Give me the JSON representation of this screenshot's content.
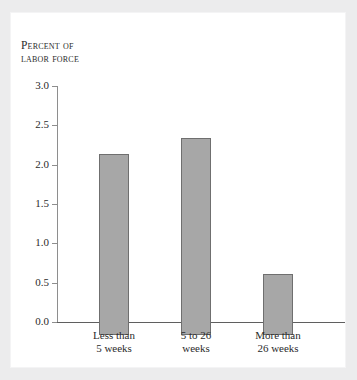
{
  "figure": {
    "background_color": "#ececed",
    "panel_color": "#ffffff"
  },
  "chart_data": {
    "type": "bar",
    "title": "",
    "subtitle": "",
    "ylabel_line1": "Percent of",
    "ylabel_line2": "labor force",
    "ylabel": "Percent of labor force",
    "xlabel": "",
    "categories": [
      "Less than 5 weeks",
      "5 to 26 weeks",
      "More than 26 weeks"
    ],
    "category_lines": [
      [
        "Less than",
        "5 weeks"
      ],
      [
        "5 to 26",
        "weeks"
      ],
      [
        "More than",
        "26 weeks"
      ]
    ],
    "values": [
      2.3,
      2.5,
      0.77
    ],
    "ylim": [
      0.0,
      3.0
    ],
    "ytick_values": [
      0.0,
      0.5,
      1.0,
      1.5,
      2.0,
      2.5,
      3.0
    ],
    "ytick_labels": [
      "0.0",
      "0.5",
      "1.0",
      "1.5",
      "2.0",
      "2.5",
      "3.0"
    ],
    "grid": false,
    "legend": null,
    "bar_color": "#a7a7a7",
    "bar_edge_color": "#6f6f6f",
    "axis_color": "#5f5f5f"
  }
}
